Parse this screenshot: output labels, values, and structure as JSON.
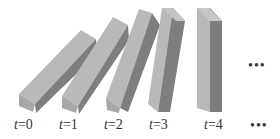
{
  "figure": {
    "colors": {
      "light_face": "#b7b7b7",
      "dark_face": "#7f7f7f",
      "top_face": "#c8c8c8",
      "text": "#333333"
    },
    "dominoes": [
      {
        "t": "t=0",
        "var": "t",
        "value": "0"
      },
      {
        "t": "t=1",
        "var": "t",
        "value": "1"
      },
      {
        "t": "t=2",
        "var": "t",
        "value": "2"
      },
      {
        "t": "t=3",
        "var": "t",
        "value": "3"
      },
      {
        "t": "t=4",
        "var": "t",
        "value": "4"
      }
    ],
    "ellipsis_mid": "•••",
    "ellipsis_label": "•••"
  }
}
